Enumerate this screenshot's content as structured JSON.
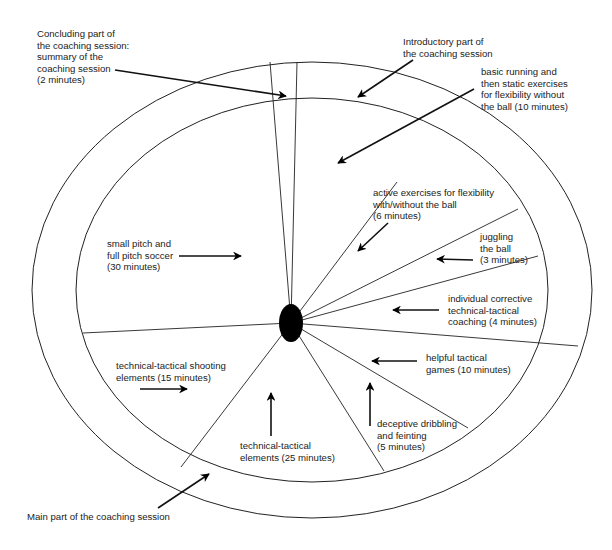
{
  "phases": {
    "introductory": "Introductory part of\nthe coaching session",
    "concluding": "Concluding part of\nthe coaching session:\nsummary of the\ncoaching session\n(2 minutes)",
    "main": "Main part of the coaching session"
  },
  "segments": [
    {
      "id": "basic-running",
      "label": "basic running and\nthen static exercises\nfor flexibility without\nthe ball (10 minutes)",
      "minutes": 10
    },
    {
      "id": "active-exercises",
      "label": "active exercises for flexibility\nwith/without the ball\n(6 minutes)",
      "minutes": 6
    },
    {
      "id": "juggling",
      "label": "juggling\nthe ball\n(3 minutes)",
      "minutes": 3
    },
    {
      "id": "individual-coaching",
      "label": "individual corrective\ntechnical-tactical\ncoaching (4 minutes)",
      "minutes": 4
    },
    {
      "id": "tactical-games",
      "label": "helpful tactical\ngames (10 minutes)",
      "minutes": 10
    },
    {
      "id": "dribbling",
      "label": "deceptive dribbling\nand feinting\n(5 minutes)",
      "minutes": 5
    },
    {
      "id": "tech-tactical",
      "label": "technical-tactical\nelements (25 minutes)",
      "minutes": 25
    },
    {
      "id": "shooting",
      "label": "technical-tactical shooting\nelements (15 minutes)",
      "minutes": 15
    },
    {
      "id": "soccer",
      "label": "small pitch and\nfull pitch soccer\n(30 minutes)",
      "minutes": 30
    }
  ],
  "colors": {
    "line": "#222222",
    "fill": "#000000",
    "background": "#ffffff"
  }
}
